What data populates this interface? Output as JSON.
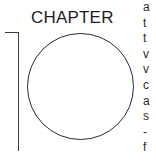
{
  "heading": {
    "label": "CHAPTER",
    "number": "10"
  },
  "body_text": {
    "truncated_line_starts": [
      "a",
      "t",
      "t",
      "v",
      "v",
      "c",
      "a",
      "s",
      "-",
      "f"
    ]
  }
}
